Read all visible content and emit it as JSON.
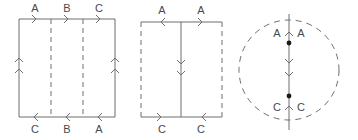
{
  "figure": {
    "width": 358,
    "height": 140,
    "background_color": "#ffffff",
    "stroke_color": "#6e6e6e",
    "label_color": "#4a4a4a",
    "dot_color": "#1a1a1a"
  },
  "diagrams": [
    {
      "id": "diagram-1",
      "shape": "rectangle",
      "bounds": {
        "x": 19,
        "y": 19,
        "width": 96,
        "height": 98
      },
      "border_style": {
        "top": "solid",
        "bottom": "solid",
        "left": "solid",
        "right": "solid"
      },
      "interior_lines": [
        {
          "orientation": "vertical",
          "x": 51,
          "style": "dashed"
        },
        {
          "orientation": "vertical",
          "x": 83,
          "style": "dashed"
        }
      ],
      "top_labels": [
        "A",
        "B",
        "C"
      ],
      "bottom_labels": [
        "C",
        "B",
        "A"
      ],
      "top_arrow_direction": "right",
      "bottom_arrow_direction": "left",
      "left_arrow_direction": "up",
      "right_arrow_direction": "up",
      "side_arrow_count": 2
    },
    {
      "id": "diagram-2",
      "shape": "rectangle",
      "bounds": {
        "x": 141,
        "y": 22,
        "width": 81,
        "height": 95
      },
      "border_style": {
        "top": "solid",
        "bottom": "solid",
        "left": "dashed",
        "right": "dashed"
      },
      "interior_lines": [
        {
          "orientation": "vertical",
          "x": 181,
          "style": "solid"
        }
      ],
      "top_labels": [
        "A",
        "A"
      ],
      "bottom_labels": [
        "C",
        "C"
      ],
      "top_left_arrow_direction": "left",
      "top_right_arrow_direction": "right",
      "bottom_left_arrow_direction": "right",
      "bottom_right_arrow_direction": "left",
      "center_arrow_direction": "down",
      "center_arrow_count": 2
    },
    {
      "id": "diagram-3",
      "shape": "circle",
      "center": {
        "x": 289,
        "y": 70
      },
      "radius": 50,
      "border_style": "dashed",
      "axis_line": {
        "orientation": "vertical",
        "x": 289,
        "y1": 14,
        "y2": 130,
        "style": "solid"
      },
      "dots": [
        {
          "x": 289,
          "y": 43
        },
        {
          "x": 289,
          "y": 96
        }
      ],
      "upper_labels": [
        "A",
        "A"
      ],
      "lower_labels": [
        "C",
        "C"
      ],
      "upper_arrow_direction": "up",
      "middle_arrow_direction": "down",
      "middle_arrow_count": 2,
      "lower_arrow_direction": "up"
    }
  ]
}
